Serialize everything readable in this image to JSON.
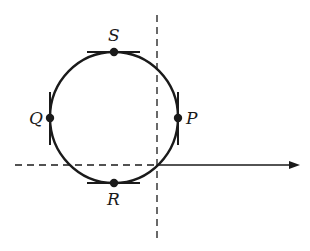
{
  "diagram": {
    "type": "loop-trajectory",
    "colors": {
      "stroke": "#1a1a1a",
      "background": "#ffffff"
    },
    "points": [
      {
        "label": "S",
        "position": "top"
      },
      {
        "label": "Q",
        "position": "left"
      },
      {
        "label": "P",
        "position": "right"
      },
      {
        "label": "R",
        "position": "bottom"
      }
    ],
    "axes": {
      "vertical": "dashed",
      "horizontal_left": "dashed",
      "horizontal_right": "solid-arrow"
    }
  }
}
